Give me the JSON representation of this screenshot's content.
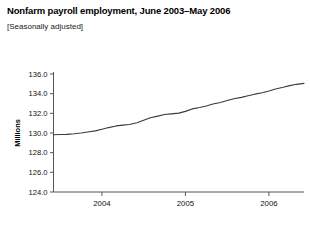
{
  "chart_data": {
    "type": "line",
    "title": "Nonfarm payroll employment, June 2003–May 2006",
    "subtitle": "[Seasonally adjusted]",
    "ylabel": "Millions",
    "xlabel": "",
    "ylim": [
      124.0,
      136.0
    ],
    "ytick_labels": [
      "136.0",
      "134.0",
      "132.0",
      "130.0",
      "128.0",
      "126.0",
      "124.0"
    ],
    "ytick_values": [
      136.0,
      134.0,
      132.0,
      130.0,
      128.0,
      126.0,
      124.0
    ],
    "xtick_labels": [
      "2004",
      "2005",
      "2006"
    ],
    "xtick_values": [
      2004.0,
      2005.0,
      2006.0
    ],
    "xlim": [
      2003.42,
      2006.42
    ],
    "grid": false,
    "legend": false,
    "line_color": "#3a3a3a",
    "series": [
      {
        "name": "Nonfarm payroll employment",
        "x": [
          2003.42,
          2003.5,
          2003.58,
          2003.67,
          2003.75,
          2003.83,
          2003.92,
          2004.0,
          2004.08,
          2004.17,
          2004.25,
          2004.33,
          2004.42,
          2004.5,
          2004.58,
          2004.67,
          2004.75,
          2004.83,
          2004.92,
          2005.0,
          2005.08,
          2005.17,
          2005.25,
          2005.33,
          2005.42,
          2005.5,
          2005.58,
          2005.67,
          2005.75,
          2005.83,
          2005.92,
          2006.0,
          2006.08,
          2006.17,
          2006.25,
          2006.33,
          2006.42
        ],
        "y": [
          129.82,
          129.84,
          129.86,
          129.92,
          130.0,
          130.1,
          130.22,
          130.38,
          130.55,
          130.72,
          130.8,
          130.86,
          131.05,
          131.3,
          131.55,
          131.72,
          131.88,
          131.95,
          132.02,
          132.2,
          132.45,
          132.6,
          132.75,
          132.95,
          133.1,
          133.3,
          133.48,
          133.62,
          133.78,
          133.95,
          134.1,
          134.28,
          134.48,
          134.65,
          134.82,
          134.95,
          135.05
        ]
      }
    ]
  },
  "footnote": "____ _____ _ __ ___ ____ __ _____ ____ __ ______ ____ _ __ ______ __ ___ ____ ____ __ _______"
}
